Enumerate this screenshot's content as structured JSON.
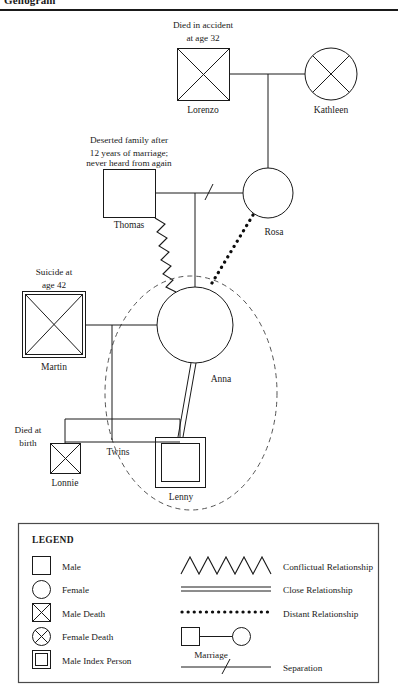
{
  "header": {
    "title": "Genogram"
  },
  "people": {
    "lorenzo": {
      "name": "Lorenzo",
      "note": [
        "Died in accident",
        "at age 32"
      ],
      "symbol": "male-death"
    },
    "kathleen": {
      "name": "Kathleen",
      "note": [],
      "symbol": "female-death"
    },
    "thomas": {
      "name": "Thomas",
      "note": [
        "Deserted family after",
        "12 years of marriage;",
        "never heard from again"
      ],
      "symbol": "male"
    },
    "rosa": {
      "name": "Rosa",
      "note": [],
      "symbol": "female"
    },
    "martin": {
      "name": "Martin",
      "note": [
        "Suicide at",
        "age 42"
      ],
      "symbol": "male-death"
    },
    "anna": {
      "name": "Anna",
      "note": [],
      "symbol": "female"
    },
    "lonnie": {
      "name": "Lonnie",
      "note": [
        "Died at",
        "birth"
      ],
      "symbol": "male-death"
    },
    "lenny": {
      "name": "Lenny",
      "note": [],
      "symbol": "male-index-person"
    }
  },
  "annotations": {
    "twins": "Twins"
  },
  "legend": {
    "title": "LEGEND",
    "symbols": [
      {
        "label": "Male",
        "icon": "square-icon"
      },
      {
        "label": "Female",
        "icon": "circle-icon"
      },
      {
        "label": "Male Death",
        "icon": "square-x-icon"
      },
      {
        "label": "Female Death",
        "icon": "circle-x-icon"
      },
      {
        "label": "Male Index Person",
        "icon": "double-square-icon"
      }
    ],
    "relationships": [
      {
        "label": "Conflictual Relationship",
        "icon": "zigzag-line-icon"
      },
      {
        "label": "Close Relationship",
        "icon": "double-line-icon"
      },
      {
        "label": "Distant Relationship",
        "icon": "dotted-line-icon"
      },
      {
        "label": "Marriage",
        "icon": "marriage-link-icon"
      },
      {
        "label": "Separation",
        "icon": "separation-slash-icon"
      }
    ]
  },
  "colors": {
    "ink": "#1a1a1a",
    "dashed": "#555555",
    "background": "#ffffff"
  }
}
